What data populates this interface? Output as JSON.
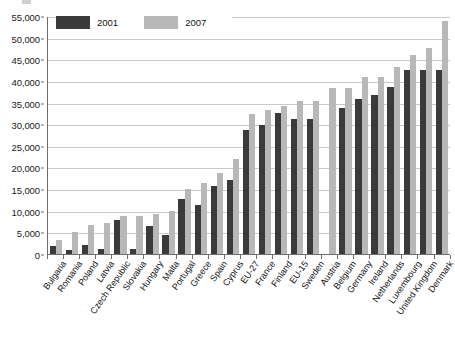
{
  "chart_data": {
    "type": "bar",
    "title": "",
    "xlabel": "",
    "ylabel": "",
    "ylim": [
      0,
      55000
    ],
    "grid": true,
    "legend_position": "top-left",
    "y_ticks": [
      "0",
      "5,000",
      "10,000",
      "15,000",
      "20,000",
      "25,000",
      "30,000",
      "35,000",
      "40,000",
      "45,000",
      "50,000",
      "55,000"
    ],
    "y_tick_values": [
      0,
      5000,
      10000,
      15000,
      20000,
      25000,
      30000,
      35000,
      40000,
      45000,
      50000,
      55000
    ],
    "categories": [
      "Bulgaria",
      "Romania",
      "Poland",
      "Latvia",
      "Czech Republic",
      "Slovakia",
      "Hungary",
      "Malta",
      "Portugal",
      "Greece",
      "Spain",
      "Cyprus",
      "EU-27",
      "France",
      "Finland",
      "EU-15",
      "Sweden",
      "Austria",
      "Belgium",
      "Germany",
      "Ireland",
      "Netherlands",
      "Luxembourg",
      "United Kingdom",
      "Denmark"
    ],
    "series": [
      {
        "name": "2001",
        "color": "#3a3a3a",
        "values": [
          1800,
          1000,
          2000,
          1100,
          7900,
          1200,
          6400,
          4300,
          12600,
          11400,
          15700,
          17000,
          28700,
          29800,
          32500,
          31100,
          31100,
          null,
          33800,
          35900,
          36700,
          38700,
          42500,
          42500,
          42500
        ]
      },
      {
        "name": "2007",
        "color": "#b8b8b8",
        "values": [
          3200,
          5200,
          6600,
          7100,
          8700,
          8900,
          9200,
          10000,
          15100,
          16500,
          18700,
          21900,
          32300,
          33300,
          34200,
          35300,
          35300,
          38400,
          38400,
          40900,
          40900,
          43200,
          45900,
          47700,
          53900
        ]
      }
    ]
  },
  "legend": {
    "items": [
      {
        "label": "2001",
        "color": "#3a3a3a"
      },
      {
        "label": "2007",
        "color": "#b8b8b8"
      }
    ]
  }
}
